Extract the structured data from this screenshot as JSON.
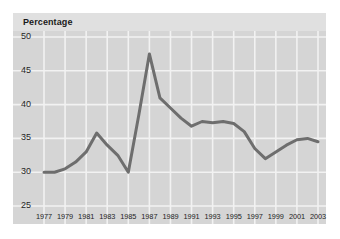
{
  "chart_data": {
    "type": "line",
    "title": "Percentage",
    "xlabel": "",
    "ylabel": "",
    "grid": true,
    "legend": "none",
    "ylim": [
      25,
      50
    ],
    "yticks": [
      25,
      30,
      35,
      40,
      45,
      50
    ],
    "ytick_labels": [
      "25",
      "30",
      "35",
      "40",
      "45",
      "50"
    ],
    "xlim": [
      1977,
      2003
    ],
    "xticks": [
      1977,
      1979,
      1981,
      1983,
      1985,
      1987,
      1989,
      1991,
      1993,
      1995,
      1997,
      1999,
      2001,
      2003
    ],
    "xtick_labels": [
      "1977",
      "1979",
      "1981",
      "1983",
      "1985",
      "1987",
      "1989",
      "1991",
      "1993",
      "1995",
      "1997",
      "1999",
      "2001",
      "2003"
    ],
    "x": [
      1977,
      1978,
      1979,
      1980,
      1981,
      1982,
      1983,
      1984,
      1985,
      1986,
      1987,
      1988,
      1989,
      1990,
      1991,
      1992,
      1993,
      1994,
      1995,
      1996,
      1997,
      1998,
      1999,
      2000,
      2001,
      2002,
      2003
    ],
    "values": [
      30.0,
      30.0,
      30.5,
      31.5,
      33.0,
      35.8,
      34.0,
      32.5,
      30.0,
      38.5,
      47.5,
      41.0,
      39.5,
      38.0,
      36.8,
      37.5,
      37.3,
      37.5,
      37.2,
      36.0,
      33.5,
      32.0,
      33.0,
      34.0,
      34.8,
      35.0,
      34.5
    ],
    "series": [
      {
        "name": "Percentage",
        "color": "#6e6e6e",
        "values": [
          30.0,
          30.0,
          30.5,
          31.5,
          33.0,
          35.8,
          34.0,
          32.5,
          30.0,
          38.5,
          47.5,
          41.0,
          39.5,
          38.0,
          36.8,
          37.5,
          37.3,
          37.5,
          37.2,
          36.0,
          33.5,
          32.0,
          33.0,
          34.0,
          34.8,
          35.0,
          34.5
        ]
      }
    ],
    "colors": {
      "line": "#6e6e6e",
      "panel_background": "#d5d5d5",
      "header_background": "#e0e0e0",
      "gridline": "#f2f2f2",
      "text": "#1f1f1f",
      "figure_background": "#ffffff"
    }
  }
}
